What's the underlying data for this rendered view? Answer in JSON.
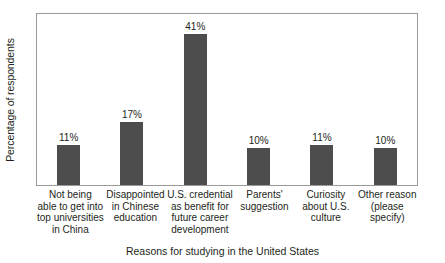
{
  "chart_data": {
    "type": "bar",
    "title": "",
    "xlabel": "Reasons for studying in the United States",
    "ylabel": "Percentage of respondents",
    "categories": [
      "Not being able to get into top universities in China",
      "Disappointed in Chinese education",
      "U.S. credential as benefit for future career development",
      "Parents' suggestion",
      "Curiosity about U.S. culture",
      "Other reason (please specify)"
    ],
    "category_lines": [
      [
        "Not being",
        "able to get into",
        "top universities",
        "in China"
      ],
      [
        "Disappointed",
        "in Chinese",
        "education"
      ],
      [
        "U.S. credential",
        "as benefit for",
        "future career",
        "development"
      ],
      [
        "Parents'",
        "suggestion"
      ],
      [
        "Curiosity",
        "about U.S.",
        "culture"
      ],
      [
        "Other reason",
        "(please",
        "specify)"
      ]
    ],
    "values": [
      11,
      17,
      41,
      10,
      11,
      10
    ],
    "value_labels": [
      "11%",
      "17%",
      "41%",
      "10%",
      "11%",
      "10%"
    ],
    "ylim": [
      0,
      47
    ],
    "grid": false,
    "y_tick_labels": [],
    "legend": false,
    "bar_color": "#4d4d4d",
    "frame_color": "#9a9a9a",
    "background_color": "#ffffff",
    "text_color": "#231f20"
  }
}
